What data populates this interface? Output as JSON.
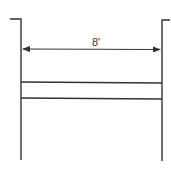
{
  "diagram": {
    "type": "dimension-drawing",
    "dimension_label": "8'",
    "stroke_color": "#333333",
    "background": "#ffffff",
    "elements": {
      "left_wall": {
        "stub": [
          [
            10,
            19
          ],
          [
            21,
            19
          ]
        ],
        "line": [
          [
            21,
            19
          ],
          [
            21,
            160
          ]
        ]
      },
      "right_wall": {
        "stub": [
          [
            162,
            20
          ],
          [
            170,
            20
          ]
        ],
        "line": [
          [
            162,
            20
          ],
          [
            162,
            161
          ]
        ]
      },
      "dimension_line": {
        "from": [
          22,
          49
        ],
        "to": [
          161,
          49
        ],
        "arrows": "both"
      },
      "rail_top": {
        "from": [
          21,
          82
        ],
        "to": [
          162,
          83
        ]
      },
      "rail_bottom": {
        "from": [
          21,
          98
        ],
        "to": [
          162,
          99
        ]
      }
    }
  }
}
